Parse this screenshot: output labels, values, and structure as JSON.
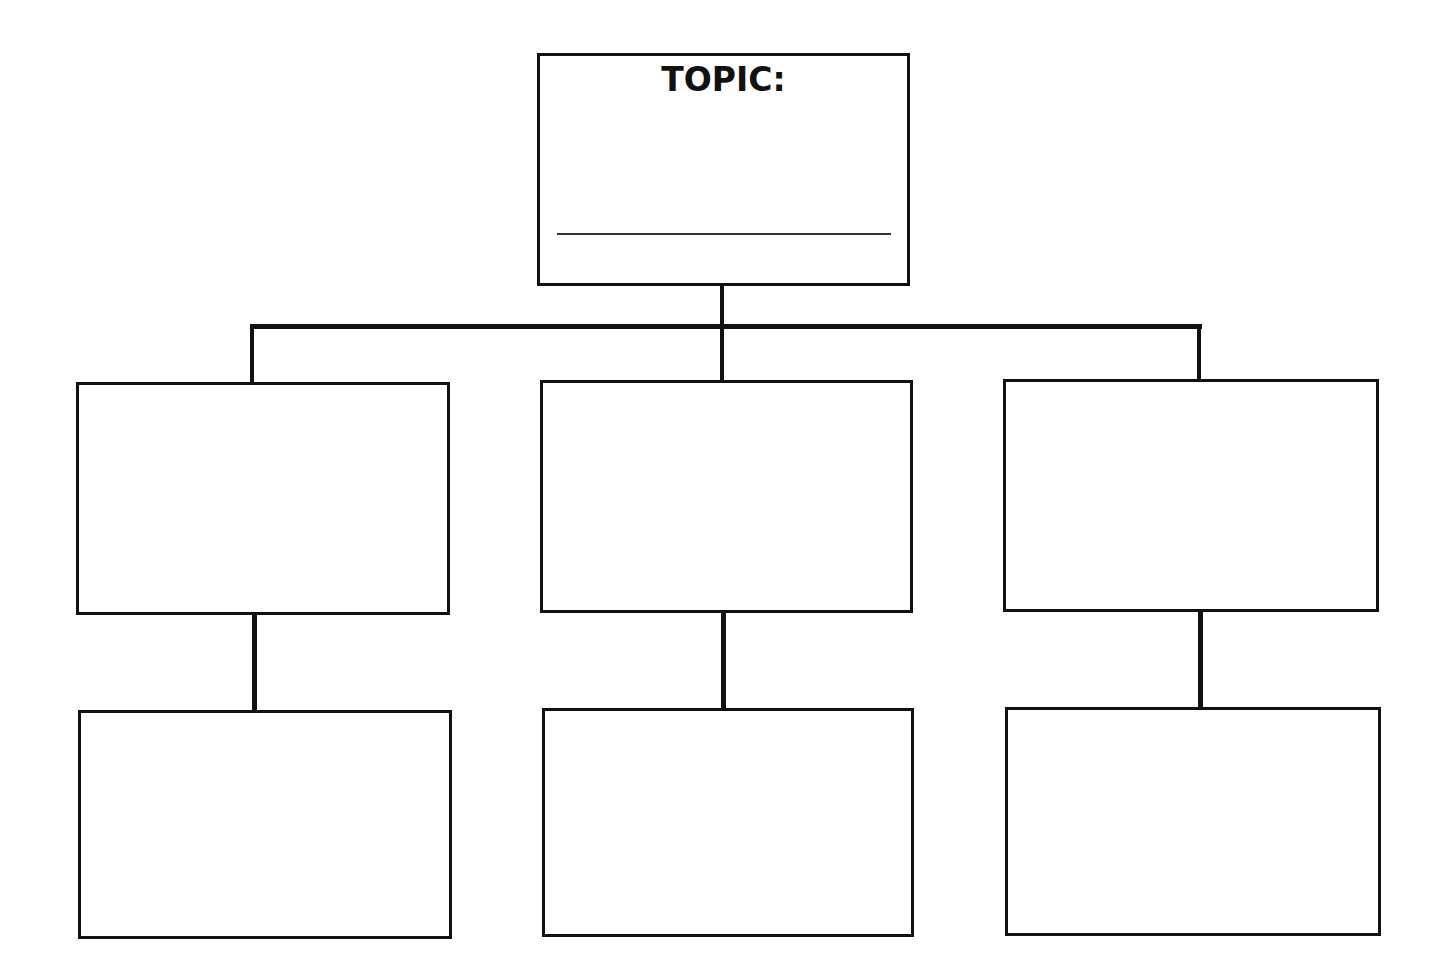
{
  "diagram": {
    "type": "hierarchy-organizer",
    "topic": {
      "label": "TOPIC:",
      "value": ""
    },
    "subtopics": [
      {
        "label": "",
        "detail": ""
      },
      {
        "label": "",
        "detail": ""
      },
      {
        "label": "",
        "detail": ""
      }
    ],
    "colors": {
      "stroke": "#111111",
      "background": "#ffffff"
    }
  }
}
